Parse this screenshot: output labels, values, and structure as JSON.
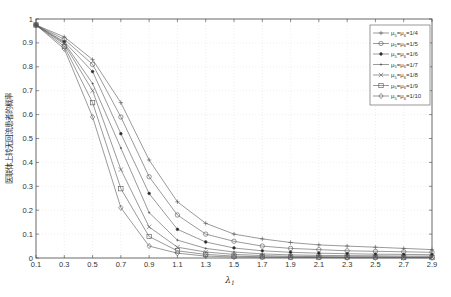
{
  "chart_data": {
    "type": "line",
    "title": "",
    "xlabel": "λ1",
    "ylabel": "医联体上转无回流患者的概率",
    "xlim": [
      0.1,
      2.9
    ],
    "ylim": [
      0,
      1
    ],
    "grid": true,
    "legend_position": "upper right",
    "x": [
      0.1,
      0.3,
      0.5,
      0.7,
      0.9,
      1.1,
      1.3,
      1.5,
      1.7,
      1.9,
      2.1,
      2.3,
      2.5,
      2.7,
      2.9
    ],
    "x_ticks": [
      "0.1",
      "0.3",
      "0.5",
      "0.7",
      "0.9",
      "1.1",
      "1.3",
      "1.5",
      "1.7",
      "1.9",
      "2.1",
      "2.3",
      "2.5",
      "2.7",
      "2.9"
    ],
    "y_ticks": [
      "0",
      "0.1",
      "0.2",
      "0.3",
      "0.4",
      "0.5",
      "0.6",
      "0.7",
      "0.8",
      "0.9",
      "1"
    ],
    "series": [
      {
        "name": "μ5=μ6=1/4",
        "marker": "plus",
        "values": [
          0.975,
          0.925,
          0.83,
          0.65,
          0.41,
          0.235,
          0.145,
          0.1,
          0.08,
          0.065,
          0.055,
          0.05,
          0.045,
          0.04,
          0.035
        ]
      },
      {
        "name": "μ5=μ6=1/5",
        "marker": "circle",
        "values": [
          0.975,
          0.915,
          0.81,
          0.59,
          0.34,
          0.18,
          0.1,
          0.07,
          0.05,
          0.04,
          0.035,
          0.03,
          0.028,
          0.026,
          0.024
        ]
      },
      {
        "name": "μ5=μ6=1/6",
        "marker": "dot",
        "values": [
          0.975,
          0.905,
          0.78,
          0.52,
          0.27,
          0.12,
          0.067,
          0.042,
          0.03,
          0.024,
          0.02,
          0.018,
          0.016,
          0.015,
          0.014
        ]
      },
      {
        "name": "μ5=μ6=1/7",
        "marker": "point",
        "values": [
          0.975,
          0.9,
          0.73,
          0.46,
          0.19,
          0.075,
          0.04,
          0.025,
          0.017,
          0.013,
          0.011,
          0.01,
          0.009,
          0.008,
          0.008
        ]
      },
      {
        "name": "μ5=μ6=1/8",
        "marker": "x",
        "values": [
          0.975,
          0.895,
          0.7,
          0.37,
          0.13,
          0.045,
          0.025,
          0.015,
          0.01,
          0.007,
          0.006,
          0.005,
          0.005,
          0.004,
          0.004
        ]
      },
      {
        "name": "μ5=μ6=1/9",
        "marker": "square",
        "values": [
          0.975,
          0.885,
          0.65,
          0.29,
          0.09,
          0.03,
          0.015,
          0.008,
          0.005,
          0.004,
          0.003,
          0.003,
          0.003,
          0.002,
          0.002
        ]
      },
      {
        "name": "μ5=μ6=1/10",
        "marker": "diamond",
        "values": [
          0.975,
          0.875,
          0.59,
          0.21,
          0.05,
          0.02,
          0.008,
          0.004,
          0.003,
          0.002,
          0.002,
          0.001,
          0.001,
          0.001,
          0.001
        ]
      }
    ]
  },
  "legend": {
    "items": [
      {
        "prefix": "μ",
        "sub1": "5",
        "mid": "=μ",
        "sub2": "6",
        "suffix": "=1/4"
      },
      {
        "prefix": "μ",
        "sub1": "5",
        "mid": "=μ",
        "sub2": "6",
        "suffix": "=1/5"
      },
      {
        "prefix": "μ",
        "sub1": "5",
        "mid": "=μ",
        "sub2": "6",
        "suffix": "=1/6"
      },
      {
        "prefix": "μ",
        "sub1": "5",
        "mid": "=μ",
        "sub2": "6",
        "suffix": "=1/7"
      },
      {
        "prefix": "μ",
        "sub1": "5",
        "mid": "=μ",
        "sub2": "6",
        "suffix": "=1/8"
      },
      {
        "prefix": "μ",
        "sub1": "5",
        "mid": "=μ",
        "sub2": "6",
        "suffix": "=1/9"
      },
      {
        "prefix": "μ",
        "sub1": "5",
        "mid": "=μ",
        "sub2": "6",
        "suffix": "=1/10"
      }
    ]
  },
  "axis": {
    "xlabel_main": "λ",
    "xlabel_sub": "1"
  },
  "colors": {
    "line": "#555555",
    "grid": "#dddddd",
    "axis": "#444444"
  }
}
